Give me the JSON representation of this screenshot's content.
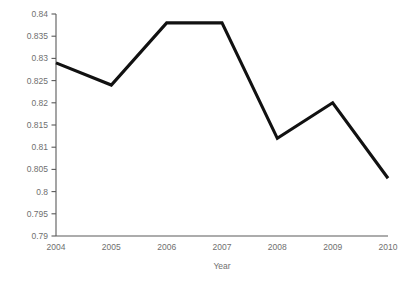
{
  "chart_data": {
    "type": "line",
    "title": "",
    "subtitle": "",
    "xlabel": "Year",
    "ylabel": "",
    "categories": [
      "2004",
      "2005",
      "2006",
      "2007",
      "2008",
      "2009",
      "2010"
    ],
    "x": [
      2004,
      2005,
      2006,
      2007,
      2008,
      2009,
      2010
    ],
    "values": [
      0.829,
      0.824,
      0.838,
      0.838,
      0.812,
      0.82,
      0.803
    ],
    "series": [
      {
        "name": "",
        "values": [
          0.829,
          0.824,
          0.838,
          0.838,
          0.812,
          0.82,
          0.803
        ]
      }
    ],
    "ylim": [
      0.79,
      0.84
    ],
    "xlim": [
      2004,
      2010
    ],
    "ytick_labels": [
      "0.79",
      "0.795",
      "0.8",
      "0.805",
      "0.81",
      "0.815",
      "0.82",
      "0.825",
      "0.83",
      "0.835",
      "0.84"
    ],
    "ytick_values": [
      0.79,
      0.795,
      0.8,
      0.805,
      0.81,
      0.815,
      0.82,
      0.825,
      0.83,
      0.835,
      0.84
    ],
    "xtick_labels": [
      "2004",
      "2005",
      "2006",
      "2007",
      "2008",
      "2009",
      "2010"
    ],
    "grid": false,
    "legend": false,
    "legend_position": "none",
    "line_color": "#111111",
    "axis_color": "#5a5a5a",
    "tick_label_color": "#6f6f6f",
    "background_color": "#ffffff",
    "annotations": []
  }
}
